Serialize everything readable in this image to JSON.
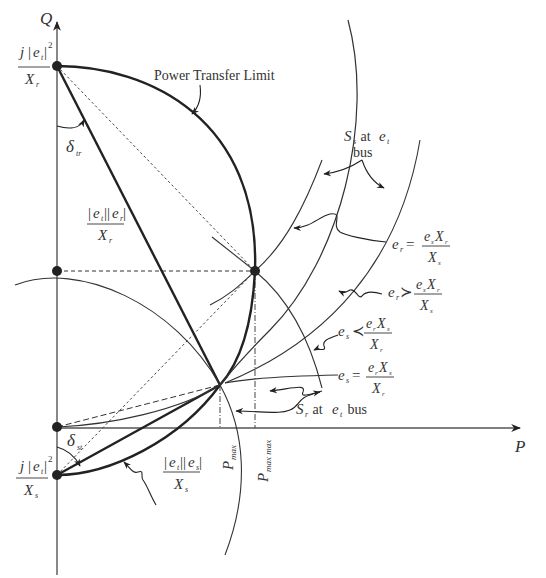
{
  "diagram": {
    "type": "power-circle-diagram",
    "axes": {
      "vertical": "Q",
      "horizontal": "P"
    },
    "labels": {
      "top_point": {
        "numer_prefix": "j",
        "numer_var": "e",
        "numer_sub": "t",
        "numer_exp": "2",
        "denom_var": "X",
        "denom_sub": "r"
      },
      "bottom_point": {
        "numer_prefix": "j",
        "numer_var": "e",
        "numer_sub": "t",
        "numer_exp": "2",
        "denom_var": "X",
        "denom_sub": "s"
      },
      "delta_tr": {
        "symbol": "δ",
        "sub": "tr"
      },
      "delta_st": {
        "symbol": "δ",
        "sub": "st"
      },
      "upper_chord": {
        "numer_a": "e",
        "numer_a_sub": "t",
        "numer_b": "e",
        "numer_b_sub": "r",
        "denom_var": "X",
        "denom_sub": "r"
      },
      "lower_chord": {
        "numer_a": "e",
        "numer_a_sub": "t",
        "numer_b": "e",
        "numer_b_sub": "s",
        "denom_var": "X",
        "denom_sub": "s"
      },
      "power_transfer_limit": "Power Transfer Limit",
      "ss_at_et_bus": {
        "main": "S",
        "sub": "s",
        "mid": " at ",
        "var": "e",
        "var_sub": "t",
        "line2": "bus"
      },
      "sr_at_et_bus": {
        "main": "S",
        "sub": "r",
        "mid": " at ",
        "var": "e",
        "var_sub": "t",
        "tail": " bus"
      },
      "p_max": {
        "main": "P",
        "sub": "max"
      },
      "p_max_max": {
        "main": "P",
        "sub": "max max"
      },
      "cond_er_eq": {
        "lhs": "e",
        "lhs_sub": "r",
        "op": "=",
        "numer_a": "e",
        "numer_a_sub": "s",
        "numer_b": "X",
        "numer_b_sub": "r",
        "denom": "X",
        "denom_sub": "s"
      },
      "cond_er_gt": {
        "lhs": "e",
        "lhs_sub": "r",
        "op": "≻",
        "numer_a": "e",
        "numer_a_sub": "s",
        "numer_b": "X",
        "numer_b_sub": "r",
        "denom": "X",
        "denom_sub": "s"
      },
      "cond_es_lt": {
        "lhs": "e",
        "lhs_sub": "s",
        "op": "≺",
        "numer_a": "e",
        "numer_a_sub": "r",
        "numer_b": "X",
        "numer_b_sub": "s",
        "denom": "X",
        "denom_sub": "r"
      },
      "cond_es_eq": {
        "lhs": "e",
        "lhs_sub": "s",
        "op": "=",
        "numer_a": "e",
        "numer_a_sub": "r",
        "numer_b": "X",
        "numer_b_sub": "s",
        "denom": "X",
        "denom_sub": "r"
      }
    },
    "colors": {
      "ink": "#222222",
      "axis": "#555555",
      "text": "#333333"
    }
  }
}
